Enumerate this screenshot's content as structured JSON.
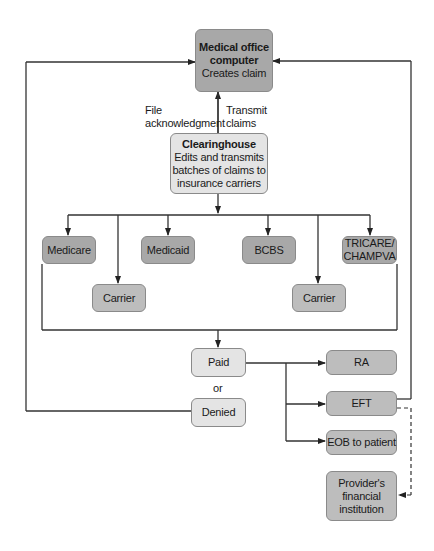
{
  "diagram": {
    "nodes": {
      "medical_office": {
        "title": "Medical office computer",
        "title_line1": "Medical office",
        "title_line2": "computer",
        "subtitle": "Creates claim"
      },
      "clearinghouse": {
        "title": "Clearinghouse",
        "line1": "Edits and transmits",
        "line2": "batches of claims to",
        "line3": "insurance carriers"
      },
      "medicare": {
        "label": "Medicare"
      },
      "medicaid": {
        "label": "Medicaid"
      },
      "bcbs": {
        "label": "BCBS"
      },
      "tricare": {
        "line1": "TRICARE/",
        "line2": "CHAMPVA"
      },
      "carrier_left": {
        "label": "Carrier"
      },
      "carrier_right": {
        "label": "Carrier"
      },
      "paid": {
        "label": "Paid"
      },
      "or": {
        "label": "or"
      },
      "denied": {
        "label": "Denied"
      },
      "ra": {
        "label": "RA"
      },
      "eft": {
        "label": "EFT"
      },
      "eob": {
        "label": "EOB to patient"
      },
      "provider_bank": {
        "line1": "Provider's",
        "line2": "financial",
        "line3": "institution"
      }
    },
    "edge_labels": {
      "file_ack_1": "File",
      "file_ack_2": "acknowledgment",
      "transmit_1": "Transmit",
      "transmit_2": "claims"
    },
    "colors": {
      "dark_box": "#a8a8a8",
      "mid_box": "#bdbdbd",
      "light_box": "#e4e4e4",
      "line": "#333333"
    }
  }
}
